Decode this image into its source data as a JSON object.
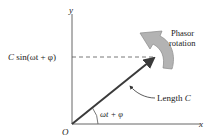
{
  "diagram": {
    "type": "phasor",
    "labels": {
      "y_axis": "y",
      "x_axis": "x",
      "origin": "O",
      "projection": "C sin(ωt + φ)",
      "projection_C": "C",
      "projection_rest": " sin(ωt + φ)",
      "angle": "ωt + φ",
      "length_word": "Length ",
      "length_var": "C",
      "rotation_line1": "Phasor",
      "rotation_line2": "rotation"
    },
    "colors": {
      "axis": "#555555",
      "phasor": "#3a3a3a",
      "rotation_arrow_fill": "#b3b3b3",
      "rotation_arrow_stroke": "#8a8a8a",
      "text": "#1a1a1a"
    }
  }
}
